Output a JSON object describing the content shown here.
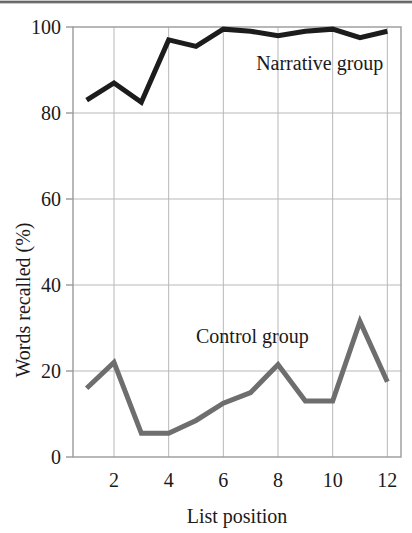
{
  "figure": {
    "background_color": "#ffffff",
    "plot_border_color": "#9a9a9a",
    "grid_color": "#b8b8b8"
  },
  "chart_data": {
    "type": "line",
    "title": "",
    "subtitle": "",
    "xlabel": "List position",
    "ylabel": "Words recalled (%)",
    "x": [
      1,
      2,
      3,
      4,
      5,
      6,
      7,
      8,
      9,
      10,
      11,
      12
    ],
    "xlim": [
      0.5,
      12.5
    ],
    "ylim": [
      0,
      100
    ],
    "xticks": [
      2,
      4,
      6,
      8,
      10,
      12
    ],
    "xtick_labels": [
      "2",
      "4",
      "6",
      "8",
      "10",
      "12"
    ],
    "yticks": [
      0,
      20,
      40,
      60,
      80,
      100
    ],
    "ytick_labels": [
      "0",
      "20",
      "40",
      "60",
      "80",
      "100"
    ],
    "grid": true,
    "grid_axis": "both",
    "legend_position": "inline-annotation",
    "series": [
      {
        "name": "Narrative group",
        "color": "#1c1c1c",
        "line_width": 5,
        "values": [
          83,
          87,
          82.5,
          97,
          95.5,
          99.5,
          99,
          98,
          99,
          99.5,
          97.5,
          99
        ],
        "annotation": {
          "text": "Narrative group",
          "x": 7.2,
          "y": 90
        }
      },
      {
        "name": "Control group",
        "color": "#6e6e6e",
        "line_width": 5,
        "values": [
          16,
          22,
          5.5,
          5.5,
          8.5,
          12.5,
          15,
          21.5,
          13,
          13,
          31.5,
          17.5
        ],
        "annotation": {
          "text": "Control group",
          "x": 5.0,
          "y": 26.5
        }
      }
    ]
  },
  "labels": {
    "y_axis_title": "Words recalled (%)",
    "x_axis_title": "List position",
    "narrative_annotation": "Narrative group",
    "control_annotation": "Control group"
  }
}
